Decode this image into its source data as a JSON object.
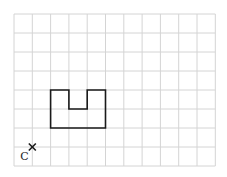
{
  "grid": {
    "columns": 11,
    "rows": 8,
    "origin_x": 14,
    "origin_y": 14,
    "cell_width": 18.3,
    "cell_height": 19,
    "line_color": "#d4d4d4"
  },
  "shape": {
    "name": "U-shaped figure",
    "stroke_color": "#1a1a1a",
    "vertices": [
      [
        2,
        4
      ],
      [
        3,
        4
      ],
      [
        3,
        5
      ],
      [
        4,
        5
      ],
      [
        4,
        4
      ],
      [
        5,
        4
      ],
      [
        5,
        6
      ],
      [
        2,
        6
      ]
    ]
  },
  "point": {
    "label": "C",
    "marker": "×",
    "grid_x": 1,
    "grid_y": 7
  }
}
